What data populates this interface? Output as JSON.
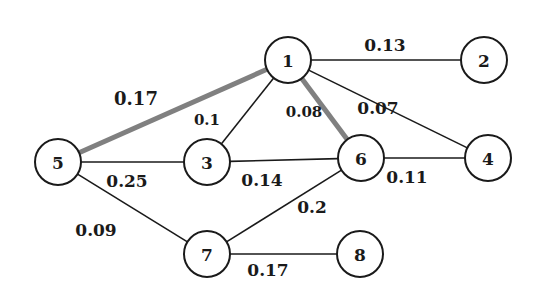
{
  "graph": {
    "highlight_color": "#808080",
    "nodes": [
      {
        "id": "1",
        "x": 288,
        "y": 60
      },
      {
        "id": "2",
        "x": 484,
        "y": 60
      },
      {
        "id": "3",
        "x": 207,
        "y": 162
      },
      {
        "id": "4",
        "x": 488,
        "y": 158
      },
      {
        "id": "5",
        "x": 58,
        "y": 162
      },
      {
        "id": "6",
        "x": 361,
        "y": 158
      },
      {
        "id": "7",
        "x": 207,
        "y": 254
      },
      {
        "id": "8",
        "x": 360,
        "y": 254
      }
    ],
    "edges": [
      {
        "from": "1",
        "to": "2",
        "weight": "0.13",
        "highlight": false,
        "lx": 385,
        "ly": 45,
        "size": 17
      },
      {
        "from": "1",
        "to": "5",
        "weight": "0.17",
        "highlight": true,
        "lx": 136,
        "ly": 98,
        "size": 18
      },
      {
        "from": "1",
        "to": "3",
        "weight": "0.1",
        "highlight": false,
        "lx": 207,
        "ly": 120,
        "size": 15
      },
      {
        "from": "1",
        "to": "6",
        "weight": "0.08",
        "highlight": true,
        "lx": 304,
        "ly": 112,
        "size": 15
      },
      {
        "from": "1",
        "to": "4",
        "weight": "0.07",
        "highlight": false,
        "lx": 378,
        "ly": 108,
        "size": 17
      },
      {
        "from": "5",
        "to": "3",
        "weight": "0.25",
        "highlight": false,
        "lx": 127,
        "ly": 181,
        "size": 17
      },
      {
        "from": "3",
        "to": "6",
        "weight": "0.14",
        "highlight": false,
        "lx": 262,
        "ly": 180,
        "size": 17
      },
      {
        "from": "6",
        "to": "4",
        "weight": "0.11",
        "highlight": false,
        "lx": 407,
        "ly": 177,
        "size": 17
      },
      {
        "from": "6",
        "to": "7",
        "weight": "0.2",
        "highlight": false,
        "lx": 312,
        "ly": 207,
        "size": 17
      },
      {
        "from": "5",
        "to": "7",
        "weight": "0.09",
        "highlight": false,
        "lx": 96,
        "ly": 230,
        "size": 17
      },
      {
        "from": "7",
        "to": "8",
        "weight": "0.17",
        "highlight": false,
        "lx": 268,
        "ly": 270,
        "size": 17
      }
    ]
  }
}
